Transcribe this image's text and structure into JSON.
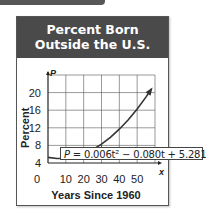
{
  "card": {
    "title_line1": "Percent Born",
    "title_line2": "Outside the U.S.",
    "header_color": "#4a4a4a"
  },
  "equation": {
    "lhs": "P",
    "text": " = 0.006t² − 0.080t + 5.281"
  },
  "chart_data": {
    "type": "line",
    "title": "Percent Born Outside the U.S.",
    "xlabel": "Years Since 1960",
    "ylabel": "Percent",
    "x_axis_var": "x",
    "y_axis_var": "P",
    "x_ticks": [
      "0",
      "10",
      "20",
      "30",
      "40",
      "50"
    ],
    "y_ticks": [
      "4",
      "8",
      "12",
      "16",
      "20"
    ],
    "xlim": [
      0,
      60
    ],
    "ylim": [
      4,
      24
    ],
    "grid": true,
    "equation": "P = 0.006t^2 - 0.080t + 5.281",
    "series": [
      {
        "name": "P(t)",
        "x": [
          0,
          5,
          10,
          15,
          20,
          25,
          30,
          35,
          40,
          45,
          50,
          55,
          58
        ],
        "values": [
          5.28,
          5.03,
          5.08,
          5.43,
          6.08,
          7.03,
          8.28,
          9.83,
          11.68,
          13.83,
          16.28,
          19.03,
          20.81
        ]
      }
    ],
    "annotation": "equation label with leader line pointing to curve near t=30"
  }
}
